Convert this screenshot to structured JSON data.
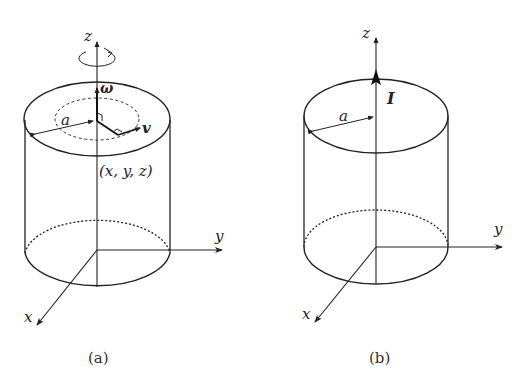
{
  "panels": [
    {
      "id": "a",
      "caption": "(a)",
      "axis_labels": {
        "z": "z",
        "y": "y",
        "x": "x"
      },
      "radius_label": "a",
      "omega_label": "ω",
      "velocity_label": "v",
      "point_label": "(x, y, z)",
      "rotation_indicator": "counterclockwise-arrow"
    },
    {
      "id": "b",
      "caption": "(b)",
      "axis_labels": {
        "z": "z",
        "y": "y",
        "x": "x"
      },
      "radius_label": "a",
      "current_label": "I"
    }
  ],
  "colors": {
    "stroke": "#222222",
    "background": "#ffffff"
  }
}
